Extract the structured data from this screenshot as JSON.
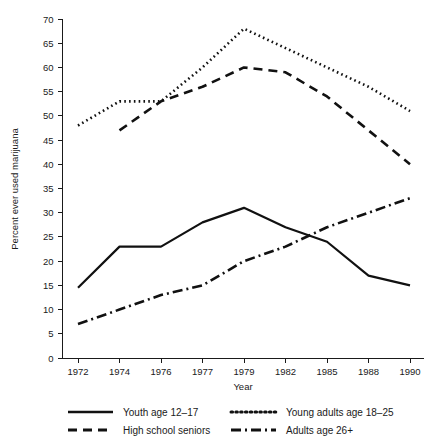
{
  "chart_data": {
    "type": "line",
    "title": "",
    "subtitle": "",
    "xlabel": "Year",
    "ylabel": "Percent ever used marijuana",
    "categories": [
      "1972",
      "1974",
      "1976",
      "1977",
      "1979",
      "1982",
      "1985",
      "1988",
      "1990"
    ],
    "xlim": [
      0,
      8
    ],
    "ylim": [
      0,
      70
    ],
    "ytick_step": 5,
    "yticks": [
      0,
      5,
      10,
      15,
      20,
      25,
      30,
      35,
      40,
      45,
      50,
      55,
      60,
      65,
      70
    ],
    "grid": false,
    "legend_position": "bottom",
    "series": [
      {
        "name": "Youth age 12-17",
        "style": "solid",
        "color": "#111111",
        "values": [
          14.5,
          23,
          23,
          28,
          31,
          27,
          24,
          17,
          15
        ]
      },
      {
        "name": "High school seniors",
        "style": "dashed",
        "color": "#111111",
        "values": [
          null,
          47,
          53,
          56,
          60,
          59,
          54,
          47,
          40
        ]
      },
      {
        "name": "Young adults age 18-25",
        "style": "dotted",
        "color": "#111111",
        "values": [
          48,
          53,
          53,
          60,
          68,
          64,
          60,
          56,
          51
        ]
      },
      {
        "name": "Adults age 26+",
        "style": "dashdot",
        "color": "#111111",
        "values": [
          7,
          10,
          13,
          15,
          20,
          23,
          27,
          30,
          33
        ]
      }
    ]
  },
  "legend": {
    "items": [
      {
        "label": "Youth age 12–17",
        "style": "solid"
      },
      {
        "label": "Young adults age 18–25",
        "style": "dotted"
      },
      {
        "label": "High school seniors",
        "style": "dashed"
      },
      {
        "label": "Adults age 26+",
        "style": "dashdot"
      }
    ]
  },
  "axes": {
    "y_title": "Percent ever used marijuana",
    "x_title": "Year"
  }
}
